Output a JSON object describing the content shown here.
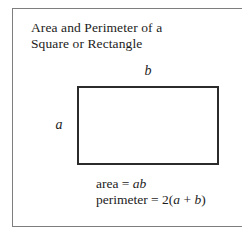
{
  "figure": {
    "title_lines": [
      "Area and Perimeter of a",
      "Square or Rectangle"
    ],
    "shape": {
      "name": "rectangle",
      "width_label": "b",
      "height_label": "a",
      "border_color": "#2b2b2b",
      "fill_color": "#ffffff"
    },
    "formulas": {
      "area": {
        "lhs": "area",
        "equals": "=",
        "rhs_vars": "ab",
        "full_text": "area = ab"
      },
      "perimeter": {
        "lhs": "perimeter",
        "equals": "=",
        "coefficient": "2",
        "open_paren": "(",
        "var_a": "a",
        "plus": "+",
        "var_b": "b",
        "close_paren": ")",
        "full_text": "perimeter = 2(a + b)"
      }
    },
    "frame_color": "#7e7e7e",
    "background_color": "#ffffff"
  }
}
